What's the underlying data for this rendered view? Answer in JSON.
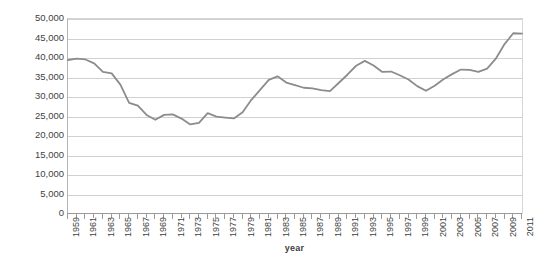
{
  "chart_data": {
    "type": "line",
    "title": "",
    "xlabel": "year",
    "ylabel": "number below poverty level",
    "xlim": [
      1959,
      2011
    ],
    "ylim": [
      0,
      50000
    ],
    "grid": true,
    "legend": "none",
    "line_color": "#8c8c8c",
    "gridline_color": "#d0d0d0",
    "axis_color": "#9a9a9a",
    "text_color": "#3f3f3f",
    "ytick_labels": [
      "50,000",
      "45,000",
      "40,000",
      "35,000",
      "30,000",
      "25,000",
      "20,000",
      "15,000",
      "10,000",
      "5,000",
      "0"
    ],
    "ytick_values": [
      50000,
      45000,
      40000,
      35000,
      30000,
      25000,
      20000,
      15000,
      10000,
      5000,
      0
    ],
    "xtick_labels": [
      "1959",
      "1961",
      "1963",
      "1965",
      "1967",
      "1969",
      "1971",
      "1973",
      "1975",
      "1977",
      "1979",
      "1981",
      "1983",
      "1985",
      "1987",
      "1989",
      "1991",
      "1993",
      "1995",
      "1997",
      "1999",
      "2001",
      "2003",
      "2005",
      "2007",
      "2009",
      "2011"
    ],
    "x": [
      1959,
      1960,
      1961,
      1962,
      1963,
      1964,
      1965,
      1966,
      1967,
      1968,
      1969,
      1970,
      1971,
      1972,
      1973,
      1974,
      1975,
      1976,
      1977,
      1978,
      1979,
      1980,
      1981,
      1982,
      1983,
      1984,
      1985,
      1986,
      1987,
      1988,
      1989,
      1990,
      1991,
      1992,
      1993,
      1994,
      1995,
      1996,
      1997,
      1998,
      1999,
      2000,
      2001,
      2002,
      2003,
      2004,
      2005,
      2006,
      2007,
      2008,
      2009,
      2010,
      2011
    ],
    "values": [
      39490,
      39851,
      39628,
      38625,
      36436,
      36055,
      33185,
      28510,
      27769,
      25389,
      24147,
      25420,
      25559,
      24460,
      22973,
      23370,
      25877,
      24975,
      24720,
      24497,
      26072,
      29272,
      31822,
      34398,
      35303,
      33700,
      33064,
      32370,
      32221,
      31745,
      31528,
      33585,
      35708,
      38014,
      39265,
      38059,
      36425,
      36529,
      35574,
      34476,
      32791,
      31581,
      32907,
      34570,
      35861,
      37040,
      36950,
      36460,
      37276,
      39829,
      43569,
      46343,
      46247
    ],
    "series_name": "number below poverty level"
  }
}
